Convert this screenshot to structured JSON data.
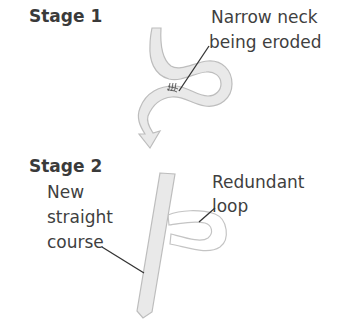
{
  "diagram": {
    "topic": "Formation of an oxbow lake (meander cut-off)",
    "stage1": {
      "title": "Stage 1",
      "annotation": {
        "line1": "Narrow neck",
        "line2": "being eroded"
      }
    },
    "stage2": {
      "title": "Stage 2",
      "annotation_left": {
        "line1": "New",
        "line2": "straight",
        "line3": "course"
      },
      "annotation_right": {
        "line1": "Redundant",
        "line2": "loop"
      }
    },
    "colors": {
      "river_fill": "#e9e9e9",
      "river_outline": "#bdbdbd",
      "text": "#3f3f3f",
      "leader_line": "#333333",
      "background": "#ffffff"
    }
  }
}
